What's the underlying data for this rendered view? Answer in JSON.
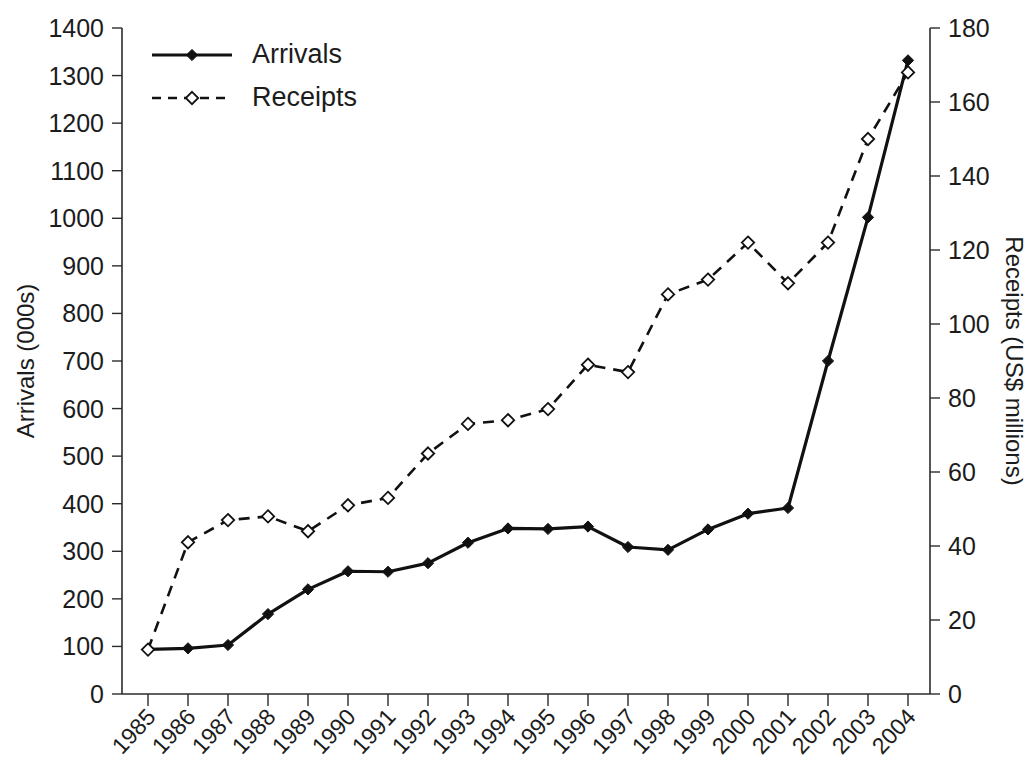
{
  "chart_data": {
    "type": "line",
    "title": "",
    "xlabel": "",
    "categories": [
      "1985",
      "1986",
      "1987",
      "1988",
      "1989",
      "1990",
      "1991",
      "1992",
      "1993",
      "1994",
      "1995",
      "1996",
      "1997",
      "1998",
      "1999",
      "2000",
      "2001",
      "2002",
      "2003",
      "2004"
    ],
    "grid": false,
    "legend_position": "top-left",
    "axes": {
      "left": {
        "label": "Arrivals (000s)",
        "ylim": [
          0,
          1400
        ],
        "tick_step": 100,
        "ticks": [
          0,
          100,
          200,
          300,
          400,
          500,
          600,
          700,
          800,
          900,
          1000,
          1100,
          1200,
          1300,
          1400
        ],
        "tick_labels": [
          "0",
          "100",
          "200",
          "300",
          "400",
          "500",
          "600",
          "700",
          "800",
          "900",
          "1000",
          "1100",
          "1200",
          "1300",
          "1400"
        ]
      },
      "right": {
        "label": "Receipts (US$ millions)",
        "ylim": [
          0,
          180
        ],
        "tick_step": 20,
        "ticks": [
          0,
          20,
          40,
          60,
          80,
          100,
          120,
          140,
          160,
          180
        ],
        "tick_labels": [
          "0",
          "20",
          "40",
          "60",
          "80",
          "100",
          "120",
          "140",
          "160",
          "180"
        ]
      }
    },
    "series": [
      {
        "name": "Arrivals",
        "axis": "left",
        "style": "solid",
        "marker": "filled-diamond",
        "unit": "000s",
        "values": [
          94,
          96,
          103,
          168,
          220,
          258,
          257,
          275,
          318,
          348,
          347,
          352,
          309,
          303,
          346,
          379,
          391,
          700,
          1002,
          1332
        ]
      },
      {
        "name": "Receipts",
        "axis": "right",
        "style": "dashed",
        "marker": "open-diamond",
        "unit": "US$ millions",
        "values": [
          12,
          41,
          47,
          48,
          44,
          51,
          53,
          65,
          73,
          74,
          77,
          89,
          87,
          108,
          112,
          122,
          111,
          122,
          150,
          168
        ]
      }
    ],
    "legend": [
      {
        "label": "Arrivals",
        "style": "solid",
        "marker": "filled-diamond"
      },
      {
        "label": "Receipts",
        "style": "dashed",
        "marker": "open-diamond"
      }
    ]
  }
}
